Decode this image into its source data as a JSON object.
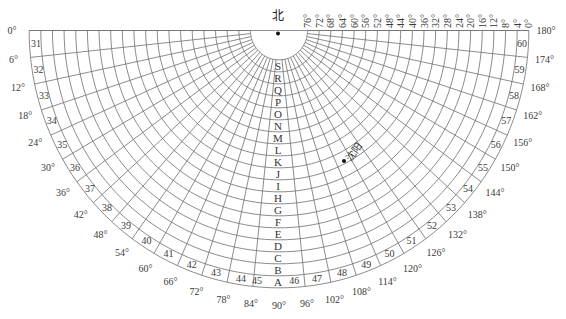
{
  "diagram": {
    "north_label": "北",
    "center_marker": "dot",
    "city": {
      "name": "沈阳",
      "marker": "dot"
    },
    "altitude_labels": [
      "76°",
      "72°",
      "68°",
      "64°",
      "60°",
      "56°",
      "52°",
      "48°",
      "44°",
      "40°",
      "36°",
      "32°",
      "28°",
      "24°",
      "20°",
      "16°",
      "12°",
      "8°",
      "4°",
      "0°"
    ],
    "band_letters": [
      "S",
      "R",
      "Q",
      "P",
      "O",
      "N",
      "M",
      "L",
      "K",
      "J",
      "I",
      "H",
      "G",
      "F",
      "E",
      "D",
      "C",
      "B",
      "A"
    ],
    "sector_numbers": [
      "31",
      "32",
      "33",
      "34",
      "35",
      "36",
      "37",
      "38",
      "39",
      "40",
      "41",
      "42",
      "43",
      "44",
      "45",
      "46",
      "47",
      "48",
      "49",
      "50",
      "51",
      "52",
      "53",
      "54",
      "55",
      "56",
      "57",
      "58",
      "59",
      "60"
    ],
    "azimuth_labels": [
      "0°",
      "6°",
      "12°",
      "18°",
      "24°",
      "30°",
      "36°",
      "42°",
      "48°",
      "54°",
      "60°",
      "66°",
      "72°",
      "78°",
      "84°",
      "90°",
      "96°",
      "102°",
      "108°",
      "114°",
      "120°",
      "126°",
      "132°",
      "138°",
      "144°",
      "150°",
      "156°",
      "162°",
      "168°",
      "174°",
      "180°"
    ],
    "colors": {
      "grid": "#6e6e6e",
      "text": "#3a3a3a",
      "marker": "#111111"
    }
  }
}
